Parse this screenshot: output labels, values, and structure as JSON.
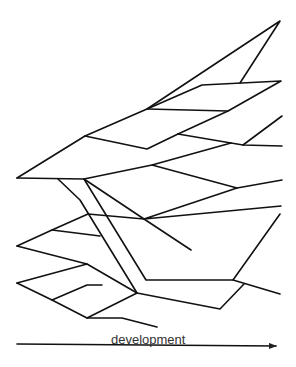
{
  "diagram": {
    "type": "branching-evolution-tree",
    "stroke_color": "#111111",
    "background": "#ffffff",
    "polylines": [
      [
        [
          17,
          178
        ],
        [
          85,
          136
        ],
        [
          147,
          109
        ],
        [
          280,
          21
        ],
        [
          240,
          83
        ]
      ],
      [
        [
          147,
          109
        ],
        [
          202,
          85
        ],
        [
          281,
          81
        ],
        [
          228,
          111
        ],
        [
          178,
          134
        ]
      ],
      [
        [
          147,
          109
        ],
        [
          228,
          111
        ]
      ],
      [
        [
          85,
          136
        ],
        [
          147,
          149
        ],
        [
          178,
          134
        ]
      ],
      [
        [
          178,
          134
        ],
        [
          231,
          143
        ],
        [
          243,
          145
        ],
        [
          282,
          146
        ]
      ],
      [
        [
          243,
          145
        ],
        [
          282,
          116
        ]
      ],
      [
        [
          17,
          178
        ],
        [
          84,
          179
        ],
        [
          152,
          165
        ],
        [
          231,
          143
        ]
      ],
      [
        [
          152,
          165
        ],
        [
          237,
          188
        ],
        [
          282,
          180
        ]
      ],
      [
        [
          237,
          188
        ],
        [
          144,
          219
        ],
        [
          281,
          206
        ]
      ],
      [
        [
          84,
          179
        ],
        [
          144,
          219
        ],
        [
          191,
          250
        ]
      ],
      [
        [
          58,
          179
        ],
        [
          80,
          200
        ],
        [
          137,
          293
        ]
      ],
      [
        [
          84,
          179
        ],
        [
          146,
          280
        ],
        [
          233,
          280
        ],
        [
          280,
          214
        ]
      ],
      [
        [
          233,
          280
        ],
        [
          280,
          294
        ]
      ],
      [
        [
          17,
          246
        ],
        [
          52,
          230
        ],
        [
          88,
          214
        ],
        [
          144,
          219
        ]
      ],
      [
        [
          52,
          230
        ],
        [
          100,
          236
        ]
      ],
      [
        [
          17,
          246
        ],
        [
          87,
          264
        ],
        [
          137,
          293
        ],
        [
          220,
          309
        ],
        [
          244,
          284
        ]
      ],
      [
        [
          17,
          283
        ],
        [
          87,
          264
        ]
      ],
      [
        [
          17,
          283
        ],
        [
          52,
          300
        ],
        [
          87,
          318
        ],
        [
          137,
          293
        ]
      ],
      [
        [
          52,
          300
        ],
        [
          87,
          285
        ],
        [
          102,
          285
        ]
      ],
      [
        [
          87,
          318
        ],
        [
          122,
          318
        ],
        [
          157,
          327
        ]
      ]
    ],
    "axis": {
      "label": "development",
      "start": [
        17,
        344
      ],
      "end": [
        276,
        346
      ],
      "arrow": "right"
    }
  }
}
